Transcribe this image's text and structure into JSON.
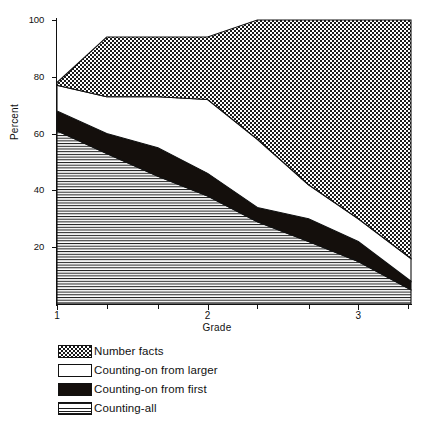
{
  "chart_data": {
    "type": "area",
    "title": "",
    "subtitle": "",
    "xlabel": "Grade",
    "ylabel": "Percent",
    "xlim": [
      1,
      3.35
    ],
    "ylim": [
      0,
      100
    ],
    "yticks": [
      20,
      40,
      60,
      80,
      100
    ],
    "xticks": [
      1,
      2,
      3
    ],
    "xminor_ticks": [
      1.33,
      1.67,
      2.33,
      2.67,
      3.33
    ],
    "grid": false,
    "legend_position": "below-left",
    "stacked": true,
    "stack_order_top_to_bottom": [
      "Number facts",
      "Counting-on from larger",
      "Counting-on from first",
      "Counting-all"
    ],
    "x": [
      1.0,
      1.33,
      1.67,
      2.0,
      2.33,
      2.67,
      3.0,
      3.35
    ],
    "series": [
      {
        "name": "Counting-all",
        "fill": "horizontal-lines",
        "values": [
          61,
          53,
          45,
          38,
          29,
          22,
          15,
          5
        ]
      },
      {
        "name": "Counting-on from first",
        "fill": "solid-black",
        "values": [
          7,
          7,
          10,
          8,
          5,
          8,
          7,
          3
        ]
      },
      {
        "name": "Counting-on from larger",
        "fill": "white",
        "values": [
          9,
          13,
          18,
          26,
          24,
          12,
          8,
          8
        ]
      },
      {
        "name": "Number facts",
        "fill": "checkerboard",
        "values": [
          1,
          21,
          21,
          22,
          42,
          58,
          70,
          84
        ]
      }
    ],
    "boundaries_cumulative": {
      "counting_all_top": [
        61,
        53,
        45,
        38,
        29,
        22,
        15,
        5
      ],
      "counting_on_from_first_top": [
        68,
        60,
        55,
        46,
        34,
        30,
        22,
        8
      ],
      "counting_on_from_larger_top": [
        77,
        73,
        73,
        72,
        58,
        42,
        30,
        16
      ],
      "number_facts_top": [
        78,
        94,
        94,
        94,
        100,
        100,
        100,
        100
      ]
    }
  },
  "legend": {
    "items": [
      {
        "label": "Number facts",
        "swatch": "checkerboard"
      },
      {
        "label": "Counting-on from larger",
        "swatch": "white"
      },
      {
        "label": "Counting-on from first",
        "swatch": "solid-black"
      },
      {
        "label": "Counting-all",
        "swatch": "horizontal-lines"
      }
    ]
  },
  "axes": {
    "ylabel": "Percent",
    "xlabel": "Grade",
    "ytick_labels": [
      "20",
      "40",
      "60",
      "80",
      "100"
    ],
    "xtick_labels": [
      "1",
      "2",
      "3"
    ]
  },
  "colors": {
    "ink": "#111111",
    "paper": "#ffffff",
    "solid_band": "#140f0c"
  }
}
